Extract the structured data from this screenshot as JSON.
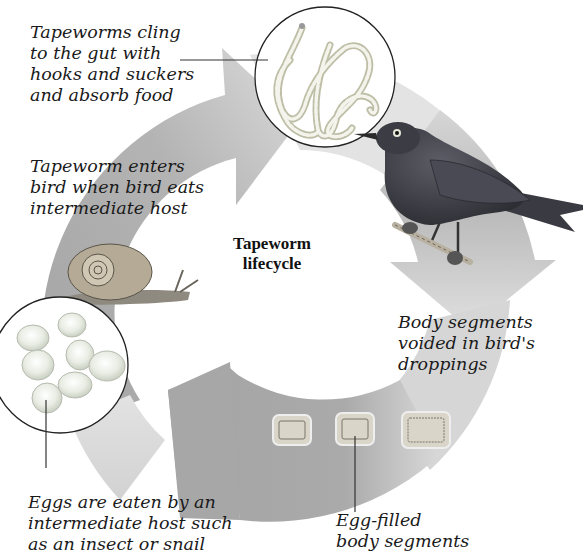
{
  "diagram": {
    "title_line1": "Tapeworm",
    "title_line2": "lifecycle",
    "colors": {
      "ring_dark": "#a6a6a6",
      "ring_light": "#d3d3d3",
      "background": "#ffffff",
      "bird": "#3e3e46",
      "text": "#1a1a1a"
    },
    "stages": [
      {
        "id": "cling",
        "label": "Tapeworms cling\nto the gut with\nhooks and suckers\nand absorb food",
        "illustration": "tapeworms-inset"
      },
      {
        "id": "voided",
        "label": "Body segments\nvoided in bird's\ndroppings",
        "illustration": "bird"
      },
      {
        "id": "segments",
        "label": "Egg-filled\nbody segments",
        "illustration": "body-segments"
      },
      {
        "id": "eggs",
        "label": "Eggs are eaten by an\nintermediate host such\nas an insect or snail",
        "illustration": "eggs-inset"
      },
      {
        "id": "enters",
        "label": "Tapeworm enters\nbird when bird eats\nintermediate host",
        "illustration": "snail"
      }
    ],
    "arrows": [
      {
        "name": "arrow-to-gut",
        "direction": "right"
      },
      {
        "name": "arrow-to-droppings",
        "direction": "down"
      },
      {
        "name": "arrow-to-eggs",
        "direction": "left"
      }
    ]
  }
}
